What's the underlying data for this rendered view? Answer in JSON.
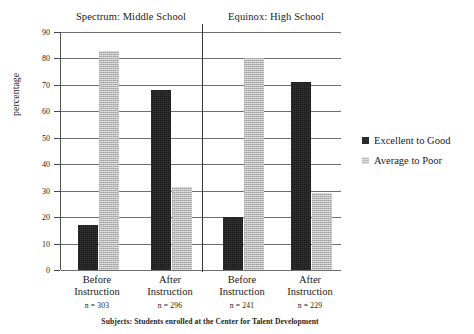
{
  "panels": [
    {
      "title": "Spectrum: Middle School"
    },
    {
      "title": "Equinox: High School"
    }
  ],
  "axis": {
    "y_caption": "percentage",
    "ticks": [
      "90",
      "80",
      "70",
      "60",
      "50",
      "40",
      "30",
      "20",
      "10",
      "0"
    ]
  },
  "groups": [
    {
      "line1": "Before",
      "line2": "Instruction",
      "n": "n = 303"
    },
    {
      "line1": "After",
      "line2": "Instruction",
      "n": "n = 296"
    },
    {
      "line1": "Before",
      "line2": "Instruction",
      "n": "n = 241"
    },
    {
      "line1": "After",
      "line2": "Instruction",
      "n": "n = 229"
    }
  ],
  "legend": [
    {
      "label": "Excellent to Good",
      "color": "#1b1b1b"
    },
    {
      "label": "Average to Poor",
      "color": "#b9b9b9"
    }
  ],
  "footer": "Subjects: Students enrolled at the Center for Talent Development",
  "chart_data": {
    "type": "bar",
    "title": "",
    "panel_titles": [
      "Spectrum: Middle School",
      "Equinox: High School"
    ],
    "categories": [
      "Before Instruction (n = 303)",
      "After Instruction (n = 296)",
      "Before Instruction (n = 241)",
      "After Instruction (n = 229)"
    ],
    "series": [
      {
        "name": "Excellent to Good",
        "color": "#1b1b1b",
        "values": [
          17,
          68,
          20,
          71
        ]
      },
      {
        "name": "Average to Poor",
        "color": "#b9b9b9",
        "values": [
          83,
          31.5,
          80,
          29
        ]
      }
    ],
    "xlabel": "",
    "ylabel": "percentage",
    "ylim": [
      0,
      90
    ],
    "ytick_step": 10,
    "grid": "horizontal",
    "legend_position": "right",
    "annotation": "Subjects: Students enrolled at the Center for Talent Development"
  }
}
